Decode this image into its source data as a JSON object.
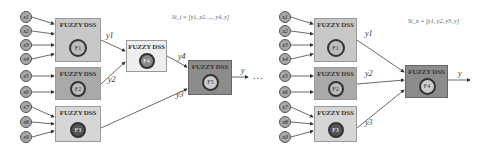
{
  "left_diagram": {
    "inputs": [
      {
        "label": "x1"
      },
      {
        "label": "x2"
      },
      {
        "label": "x3"
      },
      {
        "label": "x4"
      },
      {
        "label": "x5"
      },
      {
        "label": "x6"
      },
      {
        "label": "x7"
      },
      {
        "label": "x8"
      },
      {
        "label": "x9"
      }
    ],
    "boxes": [
      {
        "title": "FUZZY DSS",
        "node": "F1",
        "color": "#c8c8c8"
      },
      {
        "title": "FUZZY DSS",
        "node": "F2",
        "color": "#a9a9a9"
      },
      {
        "title": "FUZZY DSS",
        "node": "F3",
        "color": "#d6d6d6"
      },
      {
        "title": "FUZZY DSS",
        "node": "F4",
        "color": "#eeeeee"
      },
      {
        "title": "FUZZY DSS",
        "node": "F5",
        "color": "#8c8c8c"
      }
    ],
    "edge_labels": {
      "y1": "y1",
      "y2": "y2",
      "y3": "y3",
      "y4": "y4",
      "y": "y"
    },
    "formula": "St_i = [y1, y2, ..., y4, y]"
  },
  "separator": "...",
  "right_diagram": {
    "inputs": [
      {
        "label": "x1"
      },
      {
        "label": "x2"
      },
      {
        "label": "x3"
      },
      {
        "label": "x4"
      },
      {
        "label": "x5"
      },
      {
        "label": "x6"
      },
      {
        "label": "x7"
      },
      {
        "label": "x8"
      },
      {
        "label": "x9"
      }
    ],
    "boxes": [
      {
        "title": "FUZZY DSS",
        "node": "F1",
        "color": "#c8c8c8"
      },
      {
        "title": "FUZZY DSS",
        "node": "F2",
        "color": "#a9a9a9"
      },
      {
        "title": "FUZZY DSS",
        "node": "F3",
        "color": "#d6d6d6"
      },
      {
        "title": "FUZZY DSS",
        "node": "F4",
        "color": "#8c8c8c"
      }
    ],
    "edge_labels": {
      "y1": "y1",
      "y2": "y2",
      "y3": "y3",
      "y": "y"
    },
    "formula": "St_n = [y1, y2, y3, y]"
  }
}
